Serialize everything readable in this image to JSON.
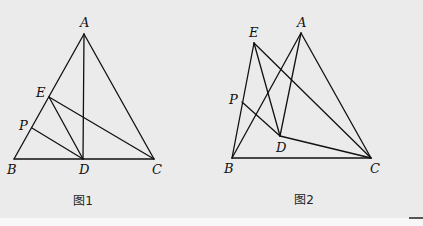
{
  "figures": [
    {
      "id": "fig1",
      "caption": "图1",
      "caption_pos": [
        83,
        205
      ],
      "points": {
        "A": {
          "xy": [
            84,
            34
          ],
          "label_xy": [
            80,
            27
          ]
        },
        "B": {
          "xy": [
            14,
            159
          ],
          "label_xy": [
            7,
            174
          ]
        },
        "C": {
          "xy": [
            154,
            159
          ],
          "label_xy": [
            152,
            174
          ]
        },
        "D": {
          "xy": [
            83,
            159
          ],
          "label_xy": [
            79,
            174
          ]
        },
        "E": {
          "xy": [
            49,
            97
          ],
          "label_xy": [
            36,
            97
          ]
        },
        "P": {
          "xy": [
            32,
            128
          ],
          "label_xy": [
            19,
            130
          ]
        }
      },
      "segments": [
        [
          "A",
          "B"
        ],
        [
          "A",
          "C"
        ],
        [
          "B",
          "C"
        ],
        [
          "A",
          "D"
        ],
        [
          "E",
          "D"
        ],
        [
          "E",
          "C"
        ],
        [
          "P",
          "D"
        ]
      ]
    },
    {
      "id": "fig2",
      "caption": "图2",
      "caption_pos": [
        304,
        204
      ],
      "points": {
        "A": {
          "xy": [
            301,
            33
          ],
          "label_xy": [
            297,
            27
          ]
        },
        "B": {
          "xy": [
            232,
            158
          ],
          "label_xy": [
            224,
            173
          ]
        },
        "C": {
          "xy": [
            371,
            158
          ],
          "label_xy": [
            370,
            173
          ]
        },
        "D": {
          "xy": [
            280,
            136
          ],
          "label_xy": [
            276,
            152
          ]
        },
        "E": {
          "xy": [
            254,
            43
          ],
          "label_xy": [
            249,
            37
          ]
        },
        "P": {
          "xy": [
            242,
            102
          ],
          "label_xy": [
            229,
            104
          ]
        }
      },
      "segments": [
        [
          "E",
          "B"
        ],
        [
          "E",
          "D"
        ],
        [
          "E",
          "C"
        ],
        [
          "A",
          "B"
        ],
        [
          "A",
          "D"
        ],
        [
          "A",
          "C"
        ],
        [
          "P",
          "D"
        ],
        [
          "D",
          "C"
        ],
        [
          "B",
          "C"
        ]
      ]
    }
  ],
  "colors": {
    "background": "#ebebeb",
    "stroke": "#111111"
  }
}
